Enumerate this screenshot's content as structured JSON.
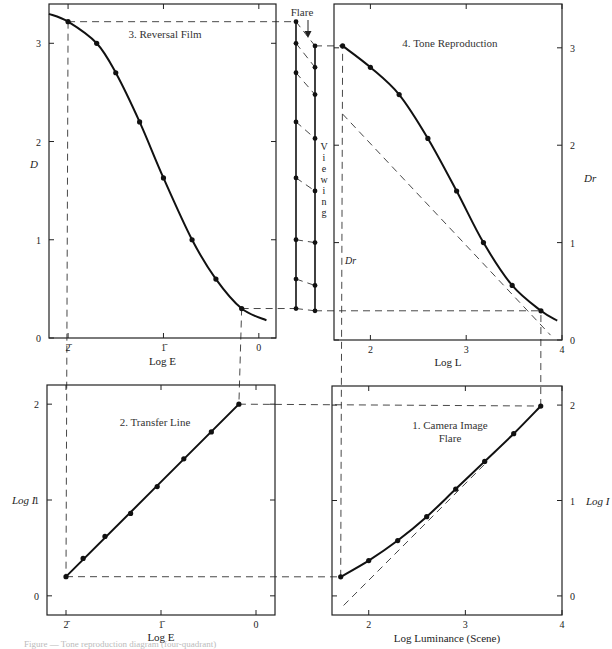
{
  "figure": {
    "caption": "Figure — Tone reproduction diagram (four-quadrant)",
    "flare_label": "Flare",
    "viewing_label": "Viewing",
    "dr_label": "Dr"
  },
  "chart_data": [
    {
      "id": "reversal_film",
      "type": "line",
      "title": "3. Reversal Film",
      "xlabel": "Log E",
      "ylabel": "D",
      "x_ticks": [
        {
          "v": -2,
          "label": "2̄"
        },
        {
          "v": -1,
          "label": "1̄"
        },
        {
          "v": 0,
          "label": "0"
        }
      ],
      "y_ticks": [
        {
          "v": 0,
          "label": "0"
        },
        {
          "v": 1,
          "label": "1"
        },
        {
          "v": 2,
          "label": "2"
        },
        {
          "v": 3,
          "label": "3"
        }
      ],
      "xlim": [
        -2.2,
        0.18
      ],
      "ylim": [
        0,
        3.4
      ],
      "curve": [
        [
          -2.2,
          3.3
        ],
        [
          -2.0,
          3.22
        ],
        [
          -1.7,
          3.0
        ],
        [
          -1.5,
          2.7
        ],
        [
          -1.25,
          2.2
        ],
        [
          -1.0,
          1.63
        ],
        [
          -0.7,
          1.0
        ],
        [
          -0.45,
          0.6
        ],
        [
          -0.18,
          0.3
        ],
        [
          0.08,
          0.18
        ]
      ],
      "points": [
        [
          -2.0,
          3.22
        ],
        [
          -1.7,
          3.0
        ],
        [
          -1.5,
          2.7
        ],
        [
          -1.25,
          2.2
        ],
        [
          -1.0,
          1.63
        ],
        [
          -0.7,
          1.0
        ],
        [
          -0.45,
          0.6
        ],
        [
          -0.18,
          0.3
        ]
      ]
    },
    {
      "id": "tone_reproduction",
      "type": "line",
      "title": "4. Tone Reproduction",
      "xlabel": "Log L",
      "ylabel": "Dr",
      "x_ticks": [
        {
          "v": 2,
          "label": "2"
        },
        {
          "v": 3,
          "label": "3"
        },
        {
          "v": 4,
          "label": "4"
        }
      ],
      "y_ticks": [
        {
          "v": 0,
          "label": "0"
        },
        {
          "v": 1,
          "label": "1"
        },
        {
          "v": 2,
          "label": "2"
        },
        {
          "v": 3,
          "label": "3"
        }
      ],
      "xlim": [
        1.62,
        4.0
      ],
      "ylim": [
        0,
        3.45
      ],
      "curve": [
        [
          1.71,
          3.02
        ],
        [
          2.0,
          2.8
        ],
        [
          2.3,
          2.52
        ],
        [
          2.6,
          2.07
        ],
        [
          2.9,
          1.53
        ],
        [
          3.18,
          1.0
        ],
        [
          3.48,
          0.56
        ],
        [
          3.78,
          0.3
        ],
        [
          3.95,
          0.2
        ]
      ],
      "points": [
        [
          1.71,
          3.02
        ],
        [
          2.0,
          2.8
        ],
        [
          2.3,
          2.52
        ],
        [
          2.6,
          2.07
        ],
        [
          2.9,
          1.53
        ],
        [
          3.18,
          1.0
        ],
        [
          3.48,
          0.56
        ],
        [
          3.78,
          0.3
        ]
      ],
      "reference_line": [
        [
          1.71,
          2.32
        ],
        [
          3.88,
          0.05
        ]
      ]
    },
    {
      "id": "transfer_line",
      "type": "line",
      "title": "2. Transfer Line",
      "xlabel": "Log E",
      "ylabel": "Log I",
      "x_ticks": [
        {
          "v": -2,
          "label": "2̄"
        },
        {
          "v": -1,
          "label": "1̄"
        },
        {
          "v": 0,
          "label": "0"
        }
      ],
      "y_ticks": [
        {
          "v": 0,
          "label": "0"
        },
        {
          "v": 1,
          "label": "1"
        },
        {
          "v": 2,
          "label": "2"
        }
      ],
      "xlim": [
        -2.2,
        0.2
      ],
      "ylim": [
        -0.2,
        2.2
      ],
      "curve": [
        [
          -2.0,
          0.2
        ],
        [
          -0.18,
          2.0
        ]
      ],
      "points": [
        [
          -2.0,
          0.2
        ],
        [
          -1.82,
          0.39
        ],
        [
          -1.59,
          0.62
        ],
        [
          -1.32,
          0.86
        ],
        [
          -1.04,
          1.14
        ],
        [
          -0.76,
          1.43
        ],
        [
          -0.47,
          1.71
        ],
        [
          -0.18,
          2.0
        ]
      ]
    },
    {
      "id": "camera_image_flare",
      "type": "line",
      "title": "1. Camera Image",
      "title_line2": "Flare",
      "xlabel": "Log Luminance (Scene)",
      "ylabel": "Log I",
      "x_ticks": [
        {
          "v": 2,
          "label": "2"
        },
        {
          "v": 3,
          "label": "3"
        },
        {
          "v": 4,
          "label": "4"
        }
      ],
      "y_ticks": [
        {
          "v": 0,
          "label": "0"
        },
        {
          "v": 1,
          "label": "1"
        },
        {
          "v": 2,
          "label": "2"
        }
      ],
      "xlim": [
        1.62,
        4.0
      ],
      "ylim": [
        -0.2,
        2.2
      ],
      "curve": [
        [
          1.71,
          0.2
        ],
        [
          2.0,
          0.37
        ],
        [
          2.3,
          0.58
        ],
        [
          2.6,
          0.83
        ],
        [
          2.9,
          1.12
        ],
        [
          3.2,
          1.41
        ],
        [
          3.5,
          1.7
        ],
        [
          3.78,
          1.99
        ]
      ],
      "points": [
        [
          1.71,
          0.2
        ],
        [
          2.0,
          0.37
        ],
        [
          2.3,
          0.58
        ],
        [
          2.6,
          0.83
        ],
        [
          2.9,
          1.12
        ],
        [
          3.2,
          1.41
        ],
        [
          3.5,
          1.7
        ],
        [
          3.78,
          1.99
        ]
      ],
      "reference_line": [
        [
          1.74,
          -0.1
        ],
        [
          3.2,
          1.38
        ]
      ]
    }
  ],
  "viewing_flare_ladder": {
    "left_levels_D": [
      3.22,
      3.0,
      2.7,
      2.2,
      1.63,
      1.0,
      0.6,
      0.3
    ],
    "right_levels_Dr": [
      3.02,
      2.8,
      2.52,
      2.07,
      1.53,
      1.0,
      0.56,
      0.3
    ]
  }
}
